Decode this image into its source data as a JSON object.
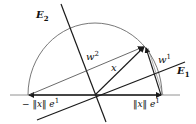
{
  "diagram": {
    "labels": {
      "E2": {
        "base": "E",
        "sub": "2"
      },
      "E1": {
        "base": "E",
        "sub": "1"
      },
      "w2": {
        "base": "w",
        "sup": "2"
      },
      "w1": {
        "base": "w",
        "sup": "1"
      },
      "x": "x",
      "neg_norm_e1": {
        "text": "− ‖x‖ e",
        "sup": "1"
      },
      "norm_e1": {
        "text": "‖x‖ e",
        "sup": "1"
      }
    },
    "colors": {
      "line": "#1a1a1a",
      "arc": "#555555",
      "thin": "#444444"
    }
  }
}
